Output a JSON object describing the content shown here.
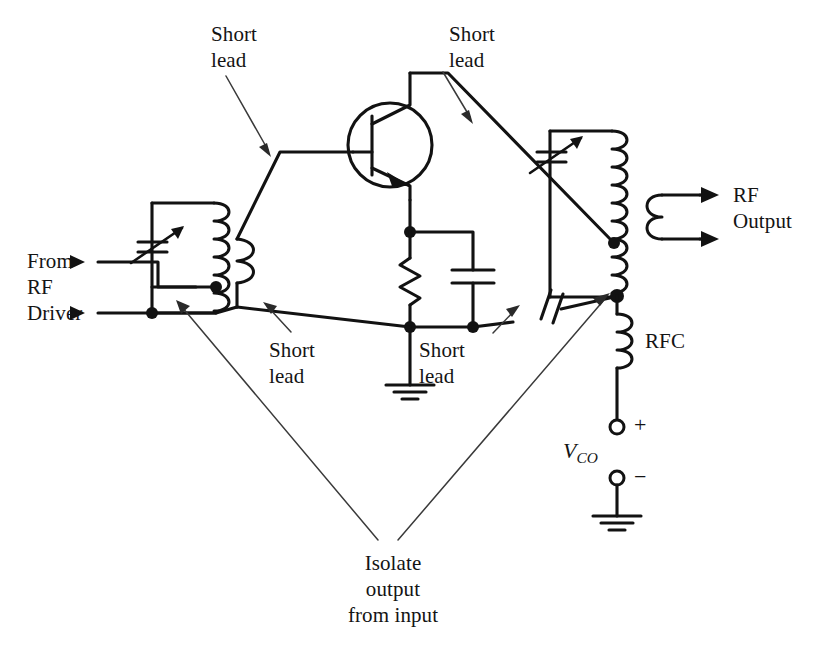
{
  "diagram": {
    "type": "schematic",
    "labels": {
      "short_lead_top_left": "Short\nlead",
      "short_lead_top_right": "Short\nlead",
      "short_lead_bottom_left": "Short\nlead",
      "short_lead_bottom_right": "Short\nlead",
      "from_rf_driver_line1": "From",
      "from_rf_driver_line2": "RF",
      "from_rf_driver_line3": "Driver",
      "rf_output_line1": "RF",
      "rf_output_line2": "Output",
      "rfc": "RFC",
      "supply_symbol": "V",
      "supply_subscript": "CO",
      "plus_sign": "+",
      "minus_sign": "−",
      "isolate_note_line1": "Isolate",
      "isolate_note_line2": "output",
      "isolate_note_line3": "from input"
    },
    "components": [
      {
        "name": "input-variable-capacitor",
        "type": "variable-capacitor"
      },
      {
        "name": "input-tank-coil",
        "type": "tapped-inductor"
      },
      {
        "name": "base-lead-coil",
        "type": "inductor"
      },
      {
        "name": "transistor-q1",
        "type": "npn-bjt"
      },
      {
        "name": "emitter-resistor",
        "type": "resistor"
      },
      {
        "name": "emitter-bypass-capacitor",
        "type": "capacitor"
      },
      {
        "name": "feedback-coupling-capacitor",
        "type": "capacitor"
      },
      {
        "name": "output-variable-capacitor",
        "type": "variable-capacitor"
      },
      {
        "name": "output-tank-coil",
        "type": "tapped-inductor"
      },
      {
        "name": "output-secondary-coil",
        "type": "inductor"
      },
      {
        "name": "rf-choke",
        "type": "inductor"
      },
      {
        "name": "emitter-ground",
        "type": "ground"
      },
      {
        "name": "supply-ground",
        "type": "ground"
      }
    ],
    "colors": {
      "ink": "#121212",
      "leader": "#3a3a3a",
      "background": "#ffffff"
    }
  }
}
